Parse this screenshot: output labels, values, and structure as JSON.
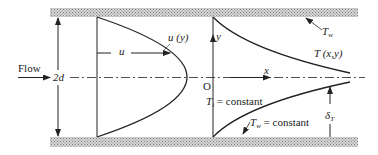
{
  "labels": {
    "flow": "Flow",
    "height": "2d",
    "velocity_profile": "u (y)",
    "velocity": "u",
    "wall_temp_top": "T",
    "wall_temp_top_sub": "w",
    "temperature_field": "T (x,y)",
    "y_axis": "y",
    "x_axis": "x",
    "origin": "O",
    "inlet_temp": "T",
    "inlet_temp_sub": "i",
    "inlet_temp_rest": " = constant",
    "wall_temp_bottom": "T",
    "wall_temp_bottom_sub": "w",
    "wall_temp_bottom_rest": " = constant",
    "thermal_boundary": "δ",
    "thermal_boundary_sub": "T"
  },
  "colors": {
    "line": "#222222",
    "wall_hatch": "#9a9a9a"
  }
}
